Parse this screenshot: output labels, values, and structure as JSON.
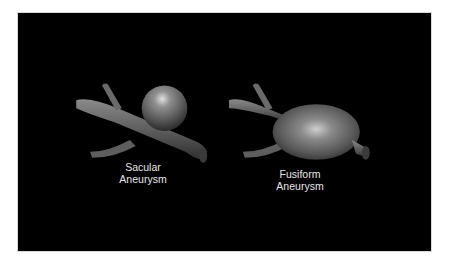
{
  "figure": {
    "background_color": "#000000",
    "vessel_color": "#6e6e6e",
    "highlight_color": "#d8d8d8",
    "items": [
      {
        "name": "saccular",
        "label_line1": "Sacular",
        "label_line2": "Aneurysm"
      },
      {
        "name": "fusiform",
        "label_line1": "Fusiform",
        "label_line2": "Aneurysm"
      }
    ]
  }
}
